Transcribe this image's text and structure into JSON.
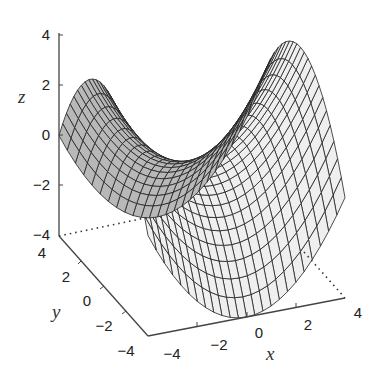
{
  "chart_data": {
    "type": "surface",
    "title": "",
    "function": "z = (x^2 - y^2) / 4",
    "xlabel": "x",
    "ylabel": "y",
    "zlabel": "z",
    "xlim": [
      -4,
      4
    ],
    "ylim": [
      -4,
      4
    ],
    "zlim": [
      -4,
      4
    ],
    "x_ticks": [
      "-4",
      "-2",
      "0",
      "2",
      "4"
    ],
    "y_ticks": [
      "4",
      "2",
      "0",
      "-2",
      "-4"
    ],
    "z_ticks": [
      "4",
      "2",
      "0",
      "-2",
      "-4"
    ],
    "grid": false,
    "mesh": {
      "x": [
        -4,
        4
      ],
      "y": [
        -4,
        4
      ],
      "n": 25
    },
    "colors": {
      "mesh_line": "#222222",
      "face_front": "#efefef",
      "face_back": "#b8b8b8",
      "axis": "#444444"
    }
  },
  "labels": {
    "x": "x",
    "y": "y",
    "z": "z",
    "z_ticks": [
      "4",
      "2",
      "0",
      "−2",
      "−4"
    ],
    "y_ticks": [
      "4",
      "2",
      "0",
      "−2",
      "−4"
    ],
    "x_ticks": [
      "−4",
      "−2",
      "0",
      "2",
      "4"
    ]
  }
}
